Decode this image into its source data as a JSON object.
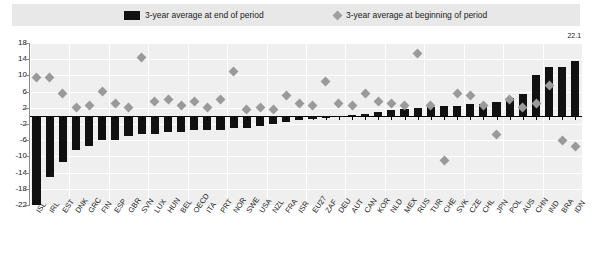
{
  "legend": {
    "series_end_label": "3-year average at end of period",
    "series_begin_label": "3-year average at beginning of period",
    "bar_color": "#111111",
    "diamond_color": "#9a9a9a"
  },
  "annotations": {
    "top_value_label": "22.1"
  },
  "chart_data": {
    "type": "bar",
    "title": "",
    "subtitle": "",
    "xlabel": "",
    "ylabel": "",
    "ylim": [
      -22,
      18
    ],
    "yticks": [
      18,
      14,
      10,
      6,
      2,
      -2,
      -6,
      -10,
      -14,
      -18,
      -22
    ],
    "ytick_labels": [
      "18",
      "14",
      "10",
      "6",
      "2",
      "-2",
      "-6",
      "-10",
      "-14",
      "-18",
      "-22"
    ],
    "grid": true,
    "legend_position": "top",
    "categories": [
      "ISL",
      "IRL",
      "EST",
      "DNK",
      "GRC",
      "FIN",
      "ESP",
      "GBR",
      "SVN",
      "LUX",
      "HUN",
      "BEL",
      "OECD",
      "ITA",
      "PRT",
      "NOR",
      "SWE",
      "USA",
      "NZL",
      "FRA",
      "ISR",
      "EU27",
      "ZAF",
      "DEU",
      "AUT",
      "CAN",
      "KOR",
      "NLD",
      "MEX",
      "RUS",
      "TUR",
      "CHE",
      "SVK",
      "CZE",
      "CHL",
      "JPN",
      "POL",
      "AUS",
      "CHN",
      "IND",
      "BRA",
      "IDN"
    ],
    "series": [
      {
        "name": "3-year average at end of period",
        "type": "bar",
        "color": "#111111",
        "values": [
          -22.0,
          -15.0,
          -11.5,
          -8.5,
          -7.5,
          -6.0,
          -6.0,
          -5.0,
          -4.5,
          -4.5,
          -4.0,
          -4.0,
          -3.5,
          -3.5,
          -3.5,
          -3.0,
          -3.0,
          -2.5,
          -2.0,
          -1.5,
          -1.0,
          -0.8,
          -0.5,
          -0.3,
          0.2,
          0.5,
          1.0,
          1.5,
          1.8,
          2.0,
          2.2,
          2.5,
          2.5,
          3.0,
          3.0,
          3.5,
          4.5,
          5.5,
          10.0,
          12.0,
          12.0,
          13.5
        ]
      },
      {
        "name": "3-year average at beginning of period",
        "type": "scatter",
        "marker": "diamond",
        "color": "#9a9a9a",
        "values": [
          9.5,
          9.5,
          5.5,
          2.0,
          2.5,
          6.0,
          3.0,
          2.0,
          14.5,
          3.5,
          4.0,
          2.5,
          3.5,
          2.0,
          4.0,
          11.0,
          1.5,
          2.0,
          1.5,
          5.0,
          3.0,
          2.5,
          8.5,
          3.0,
          2.5,
          5.5,
          3.5,
          3.0,
          2.5,
          15.5,
          2.5,
          -11.0,
          5.5,
          5.0,
          2.5,
          -4.5,
          4.0,
          2.0,
          3.0,
          7.5,
          -6.0,
          -7.5
        ]
      }
    ]
  }
}
